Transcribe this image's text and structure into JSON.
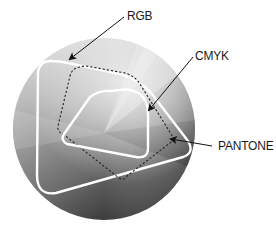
{
  "labels": {
    "rgb": "RGB",
    "cmyk": "CMYK",
    "pantone": "PANTONE"
  },
  "gamuts": [
    {
      "name": "RGB",
      "style": "solid white outline",
      "role": "largest rounded triangle"
    },
    {
      "name": "CMYK",
      "style": "solid white outline",
      "role": "inner rounded triangle"
    },
    {
      "name": "PANTONE",
      "style": "dashed dark outline",
      "role": "mid rounded quadrilateral"
    }
  ],
  "colors": {
    "background": "#ffffff",
    "sphere_light": "#d9d9d9",
    "sphere_dark": "#3a3a3a",
    "outline_white": "#ffffff",
    "outline_dashed": "#222222",
    "text": "#1a1a1a"
  }
}
